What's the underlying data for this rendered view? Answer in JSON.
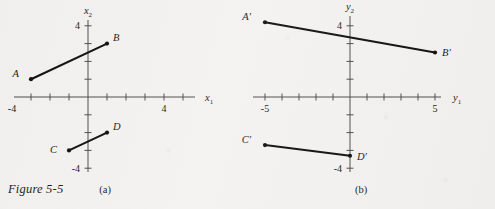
{
  "figure": {
    "caption": "Figure 5-5",
    "panel_a_tag": "(a)",
    "panel_b_tag": "(b)",
    "background_color": "#f3f2f0",
    "ink_color": "#111111",
    "axis_color": "#4d4d4d"
  },
  "chart_data": [
    {
      "type": "scatter",
      "id": "panel-a",
      "title": "",
      "xlabel": "x1",
      "ylabel": "x2",
      "xlabel_base": "x",
      "xlabel_sub": "1",
      "ylabel_base": "x",
      "ylabel_sub": "2",
      "xlim": [
        -5.2,
        5.6
      ],
      "ylim": [
        -5.4,
        5.2
      ],
      "grid": false,
      "legend": "none",
      "xticks": [
        -5,
        -4,
        -3,
        -2,
        -1,
        1,
        2,
        3,
        4,
        5
      ],
      "yticks": [
        -4,
        -3,
        -2,
        -1,
        1,
        2,
        3,
        4
      ],
      "xtick_labels": [
        {
          "value": -4,
          "text": "-4"
        },
        {
          "value": 4,
          "text": "4"
        }
      ],
      "ytick_labels": [
        {
          "value": 4,
          "text": "4"
        },
        {
          "value": -4,
          "text": "-4"
        }
      ],
      "points": [
        {
          "name": "A",
          "label": "A",
          "x": -3.0,
          "y": 1.0,
          "label_dx": -12,
          "label_dy": -2
        },
        {
          "name": "B",
          "label": "B",
          "x": 1.0,
          "y": 3.0,
          "label_dx": 6,
          "label_dy": -3
        },
        {
          "name": "C",
          "label": "C",
          "x": -1.0,
          "y": -3.0,
          "label_dx": -12,
          "label_dy": 3
        },
        {
          "name": "D",
          "label": "D",
          "x": 1.0,
          "y": -2.0,
          "label_dx": 6,
          "label_dy": -3
        }
      ],
      "segments": [
        {
          "name": "AB",
          "from": "A",
          "to": "B"
        },
        {
          "name": "CD",
          "from": "C",
          "to": "D"
        }
      ]
    },
    {
      "type": "scatter",
      "id": "panel-b",
      "title": "",
      "xlabel": "y1",
      "ylabel": "y2",
      "xlabel_base": "y",
      "xlabel_sub": "1",
      "ylabel_base": "y",
      "ylabel_sub": "2",
      "xlim": [
        -6.6,
        7.0
      ],
      "ylim": [
        -5.4,
        5.2
      ],
      "grid": false,
      "legend": "none",
      "xticks": [
        -6,
        -5,
        -4,
        -3,
        -2,
        -1,
        1,
        2,
        3,
        4,
        5,
        6
      ],
      "yticks": [
        -4,
        -3,
        -2,
        -1,
        1,
        2,
        3,
        4
      ],
      "xtick_labels": [
        {
          "value": -5,
          "text": "-5"
        },
        {
          "value": 5,
          "text": "5"
        }
      ],
      "ytick_labels": [
        {
          "value": 4,
          "text": "4"
        },
        {
          "value": -4,
          "text": "-4"
        }
      ],
      "points": [
        {
          "name": "A'",
          "label": "A′",
          "x": -5.0,
          "y": 4.2,
          "label_dx": -14,
          "label_dy": -2
        },
        {
          "name": "B'",
          "label": "B′",
          "x": 5.0,
          "y": 2.5,
          "label_dx": 7,
          "label_dy": 3
        },
        {
          "name": "C'",
          "label": "C′",
          "x": -5.0,
          "y": -2.7,
          "label_dx": -14,
          "label_dy": -2
        },
        {
          "name": "D'",
          "label": "D′",
          "x": 0.0,
          "y": -3.3,
          "label_dx": 7,
          "label_dy": 4
        }
      ],
      "segments": [
        {
          "name": "A'B'",
          "from": "A'",
          "to": "B'"
        },
        {
          "name": "C'D'",
          "from": "C'",
          "to": "D'"
        }
      ]
    }
  ]
}
